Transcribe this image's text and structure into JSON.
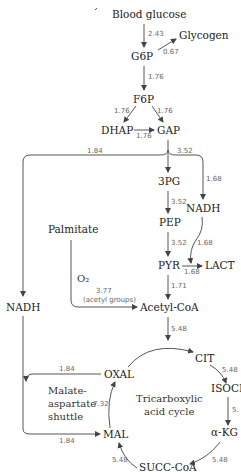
{
  "diagram": {
    "nodes": {
      "blood_glucose": "Blood glucose",
      "glycogen": "Glycogen",
      "g6p": "G6P",
      "f6p": "F6P",
      "dhap": "DHAP",
      "gap": "GAP",
      "pg3": "3PG",
      "nadh_right": "NADH",
      "pep": "PEP",
      "pyr": "PYR",
      "lact": "LACT",
      "palmitate": "Palmitate",
      "acetyl_coa": "Acetyl-CoA",
      "nadh_left": "NADH",
      "cit": "CIT",
      "isocit": "ISOCIT",
      "akg": "α-KG",
      "succ_coa": "SUCC-CoA",
      "mal": "MAL",
      "oxal": "OXAL"
    },
    "labels": {
      "o2": "O₂",
      "acetyl_groups": "(acetyl groups)",
      "shuttle_1": "Malate-",
      "shuttle_2": "aspartate",
      "shuttle_3": "shuttle",
      "tca_1": "Tricarboxylic",
      "tca_2": "acid cycle"
    },
    "rates": {
      "glucose_g6p": "2.43",
      "g6p_glycogen": "0.67",
      "g6p_f6p": "1.76",
      "f6p_dhap": "1.76",
      "f6p_gap": "1.76",
      "dhap_gap": "1.76",
      "gap_nadh_left": "1.84",
      "gap_3pg": "3.52",
      "gap_nadh_right": "1.68",
      "pg3_pep": "3.52",
      "pep_pyr": "3.52",
      "nadh_lact": "1.68",
      "pyr_lact": "1.68",
      "pyr_acetyl": "1.71",
      "palmitate_acetyl": "3.77",
      "acetyl_cit": "5.48",
      "cit_isocit": "5.48",
      "isocit_akg": "5.",
      "akg_succ": "5.48",
      "succ_mal": "5.48",
      "mal_oxal": "7.32",
      "oxal_nadh": "1.84",
      "nadh_mal": "1.84"
    }
  }
}
